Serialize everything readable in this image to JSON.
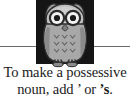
{
  "image": {
    "type": "educational-clipart-caption",
    "background_color": "#ffffff",
    "width": 130,
    "height": 100
  },
  "divider": {
    "name": "horizontal-rule",
    "color": "#6b6b6b",
    "y": 46
  },
  "illustration": {
    "subject": "owl",
    "plate_color": "#151515",
    "body_color": "#a8a8a8",
    "body_shadow_color": "#8a8a8a",
    "face_color": "#cfcfcf",
    "eye_ring_color": "#2a2a2a",
    "eye_white_color": "#f2f2f2",
    "pupil_color": "#1a1a1a",
    "beak_color": "#7d7d7d",
    "feather_mark": "v",
    "feather_rows": 3,
    "feather_per_row": 3,
    "ear_tufts": 2,
    "feet": 2
  },
  "caption": {
    "line1": "To make a possessive",
    "line2_before": "noun, add ’ or ",
    "line2_bold": "’s",
    "line2_after": ".",
    "full_text": "To make a possessive noun, add ’ or ’s.",
    "text_color": "#1b1b1b"
  }
}
